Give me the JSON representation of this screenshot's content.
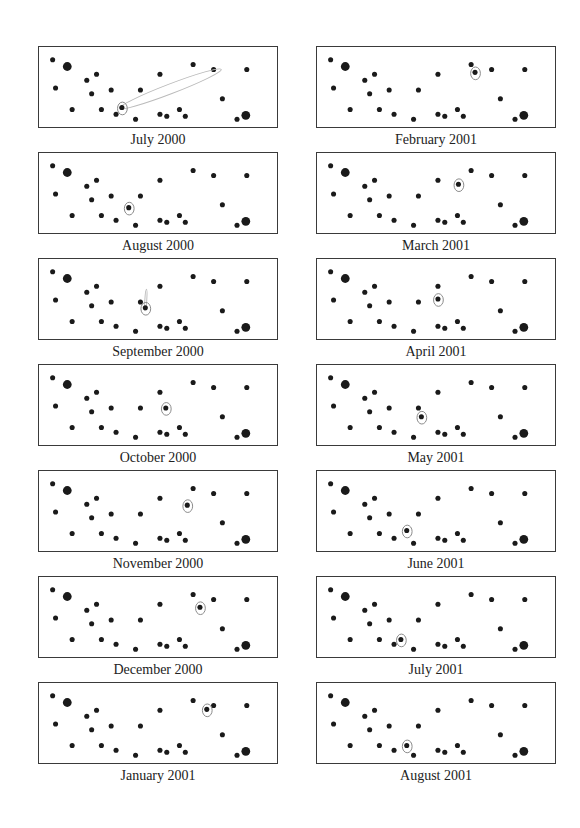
{
  "figure": {
    "stars": [
      {
        "x": 12,
        "y": 13,
        "r": 2.6
      },
      {
        "x": 27,
        "y": 20,
        "r": 4.5
      },
      {
        "x": 57,
        "y": 28,
        "r": 2.6
      },
      {
        "x": 47,
        "y": 34,
        "r": 2.6
      },
      {
        "x": 15,
        "y": 42,
        "r": 2.6
      },
      {
        "x": 52,
        "y": 48,
        "r": 2.6
      },
      {
        "x": 72,
        "y": 44,
        "r": 2.6
      },
      {
        "x": 102,
        "y": 44,
        "r": 2.6
      },
      {
        "x": 32,
        "y": 64,
        "r": 2.6
      },
      {
        "x": 62,
        "y": 64,
        "r": 2.6
      },
      {
        "x": 77,
        "y": 69,
        "r": 2.6
      },
      {
        "x": 97,
        "y": 74,
        "r": 2.6
      },
      {
        "x": 122,
        "y": 28,
        "r": 2.6
      },
      {
        "x": 156,
        "y": 18,
        "r": 2.6
      },
      {
        "x": 177,
        "y": 23,
        "r": 2.6
      },
      {
        "x": 211,
        "y": 23,
        "r": 2.6
      },
      {
        "x": 186,
        "y": 53,
        "r": 2.6
      },
      {
        "x": 122,
        "y": 69,
        "r": 2.6
      },
      {
        "x": 129,
        "y": 71,
        "r": 2.6
      },
      {
        "x": 142,
        "y": 64,
        "r": 2.6
      },
      {
        "x": 148,
        "y": 71,
        "r": 2.6
      },
      {
        "x": 201,
        "y": 74,
        "r": 2.6
      },
      {
        "x": 210,
        "y": 70,
        "r": 4.5
      }
    ],
    "panels": [
      {
        "label": "July 2000",
        "col": 0,
        "row": 0,
        "comet": {
          "x": 83,
          "y": 62
        },
        "tail": {
          "x": 182,
          "y": 24,
          "width": 9
        }
      },
      {
        "label": "August 2000",
        "col": 0,
        "row": 1,
        "comet": {
          "x": 90,
          "y": 56
        }
      },
      {
        "label": "September 2000",
        "col": 0,
        "row": 2,
        "comet": {
          "x": 107,
          "y": 50
        },
        "tail": {
          "x": 108,
          "y": 34,
          "width": 1
        }
      },
      {
        "label": "October 2000",
        "col": 0,
        "row": 3,
        "comet": {
          "x": 128,
          "y": 44
        }
      },
      {
        "label": "November 2000",
        "col": 0,
        "row": 4,
        "comet": {
          "x": 150,
          "y": 35
        }
      },
      {
        "label": "December 2000",
        "col": 0,
        "row": 5,
        "comet": {
          "x": 163,
          "y": 31
        }
      },
      {
        "label": "January 2001",
        "col": 0,
        "row": 6,
        "comet": {
          "x": 170,
          "y": 27
        }
      },
      {
        "label": "February 2001",
        "col": 1,
        "row": 0,
        "comet": {
          "x": 160,
          "y": 26
        }
      },
      {
        "label": "March 2001",
        "col": 1,
        "row": 1,
        "comet": {
          "x": 143,
          "y": 32
        }
      },
      {
        "label": "April 2001",
        "col": 1,
        "row": 2,
        "comet": {
          "x": 122,
          "y": 41
        }
      },
      {
        "label": "May 2001",
        "col": 1,
        "row": 3,
        "comet": {
          "x": 105,
          "y": 53
        }
      },
      {
        "label": "June 2001",
        "col": 1,
        "row": 4,
        "comet": {
          "x": 90,
          "y": 61
        }
      },
      {
        "label": "July 2001",
        "col": 1,
        "row": 5,
        "comet": {
          "x": 84,
          "y": 64
        }
      },
      {
        "label": "August 2001",
        "col": 1,
        "row": 6,
        "comet": {
          "x": 90,
          "y": 64
        }
      }
    ]
  },
  "layout": {
    "col_x": [
      38,
      316
    ],
    "row_y": [
      46,
      152,
      258,
      364,
      470,
      576,
      682
    ],
    "caption_offset": 86
  },
  "colors": {
    "star": "#1a1a1a",
    "border": "#3a3a3a",
    "comet_ring": "#888888"
  }
}
